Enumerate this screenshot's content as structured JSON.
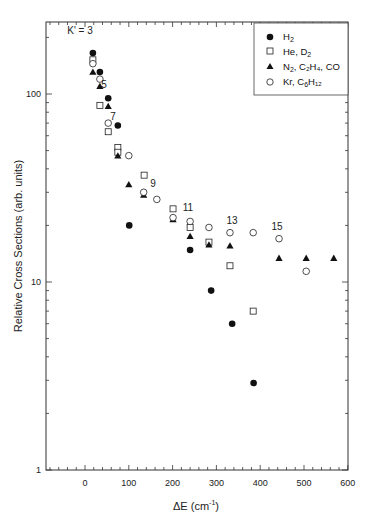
{
  "chart_data": {
    "type": "scatter",
    "title": "",
    "xlabel": "ΔE (cm⁻¹)",
    "ylabel": "Relative Cross Sections (arb. units)",
    "xlim": [
      -90,
      600
    ],
    "ylim": [
      1,
      230
    ],
    "yscale": "log",
    "x_ticks": [
      0,
      100,
      200,
      300,
      400,
      500,
      600
    ],
    "y_ticks": [
      1,
      10,
      100
    ],
    "grid": false,
    "legend_position": "upper right",
    "annotations": [
      {
        "text": "K' = 3",
        "x": 18,
        "y": 230
      },
      {
        "text": "5",
        "x": 45,
        "y": 113
      },
      {
        "text": "7",
        "x": 87,
        "y": 56
      },
      {
        "text": "9",
        "x": 165,
        "y": 30
      },
      {
        "text": "11",
        "x": 240,
        "y": 23
      },
      {
        "text": "13",
        "x": 335,
        "y": 20
      },
      {
        "text": "15",
        "x": 440,
        "y": 18
      }
    ],
    "series": [
      {
        "name": "H₂",
        "marker": "filled-circle",
        "x": [
          18,
          34,
          53,
          75,
          101,
          240,
          288,
          336,
          385
        ],
        "y": [
          165,
          131,
          95,
          68,
          20,
          14.8,
          9,
          6,
          2.9
        ]
      },
      {
        "name": "He, D₂",
        "marker": "open-square",
        "x": [
          18,
          34,
          53,
          75,
          75,
          135,
          201,
          240,
          283,
          331,
          384
        ],
        "y": [
          152,
          87,
          63,
          52,
          49,
          37,
          24.5,
          19.5,
          16.3,
          12.2,
          7
        ]
      },
      {
        "name": "N₂, C₂H₄, CO",
        "marker": "filled-triangle",
        "x": [
          18,
          34,
          53,
          75,
          100,
          134,
          201,
          240,
          283,
          331,
          443,
          505,
          568
        ],
        "y": [
          131,
          110,
          86,
          47,
          33,
          29,
          21.5,
          17.5,
          15.8,
          15.6,
          13.4,
          13.4,
          13.4
        ]
      },
      {
        "name": "Kr, C₆H₁₂",
        "marker": "open-circle",
        "x": [
          18,
          34,
          53,
          100,
          134,
          164,
          201,
          240,
          283,
          331,
          384,
          443,
          505
        ],
        "y": [
          145,
          120,
          70,
          47,
          30,
          27.5,
          22,
          21,
          19.5,
          18.3,
          18.3,
          17,
          11.4
        ]
      }
    ]
  },
  "axes": {
    "x_title_main": "ΔE (cm",
    "x_title_sup": "-1",
    "x_title_end": ")",
    "y_title": "Relative Cross Sections (arb. units)",
    "x_tick_labels": [
      "0",
      "100",
      "200",
      "300",
      "400",
      "500",
      "600"
    ],
    "y_tick_labels": [
      "1",
      "10",
      "100"
    ]
  },
  "legend": {
    "items": [
      {
        "label": "H",
        "sub": "2",
        "rest": ""
      },
      {
        "label": "He, D",
        "sub": "2",
        "rest": ""
      },
      {
        "label": "N",
        "sub": "2",
        "rest": ", C₂H₄, CO"
      },
      {
        "label": "Kr, C",
        "sub": "6",
        "rest": "H₁₂"
      }
    ]
  },
  "colors": {
    "ink": "#1a1a1a",
    "background": "#ffffff"
  }
}
